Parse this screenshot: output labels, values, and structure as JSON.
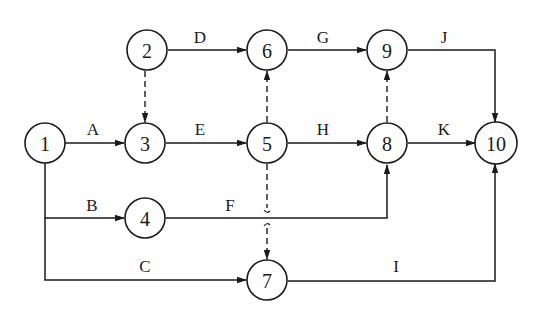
{
  "diagram": {
    "type": "activity-on-arrow network",
    "colors": {
      "stroke": "#1a1a1a",
      "background": "#ffffff"
    },
    "nodes": [
      {
        "id": "1",
        "label": "1",
        "x": 45,
        "y": 143
      },
      {
        "id": "2",
        "label": "2",
        "x": 147,
        "y": 50
      },
      {
        "id": "3",
        "label": "3",
        "x": 145,
        "y": 143
      },
      {
        "id": "4",
        "label": "4",
        "x": 145,
        "y": 218
      },
      {
        "id": "5",
        "label": "5",
        "x": 267,
        "y": 143
      },
      {
        "id": "6",
        "label": "6",
        "x": 267,
        "y": 50
      },
      {
        "id": "7",
        "label": "7",
        "x": 267,
        "y": 280
      },
      {
        "id": "8",
        "label": "8",
        "x": 387,
        "y": 143
      },
      {
        "id": "9",
        "label": "9",
        "x": 387,
        "y": 50
      },
      {
        "id": "10",
        "label": "10",
        "x": 496,
        "y": 143
      }
    ],
    "activities": [
      {
        "label": "A",
        "from": "1",
        "to": "3"
      },
      {
        "label": "B",
        "from": "1",
        "to": "4"
      },
      {
        "label": "C",
        "from": "1",
        "to": "7"
      },
      {
        "label": "D",
        "from": "2",
        "to": "6"
      },
      {
        "label": "E",
        "from": "3",
        "to": "5"
      },
      {
        "label": "F",
        "from": "4",
        "to": "8"
      },
      {
        "label": "G",
        "from": "6",
        "to": "9"
      },
      {
        "label": "H",
        "from": "5",
        "to": "8"
      },
      {
        "label": "I",
        "from": "7",
        "to": "10"
      },
      {
        "label": "J",
        "from": "9",
        "to": "10"
      },
      {
        "label": "K",
        "from": "8",
        "to": "10"
      }
    ],
    "dummy_activities": [
      {
        "from": "2",
        "to": "3"
      },
      {
        "from": "5",
        "to": "6"
      },
      {
        "from": "8",
        "to": "9"
      },
      {
        "from": "5",
        "to": "7"
      }
    ]
  }
}
